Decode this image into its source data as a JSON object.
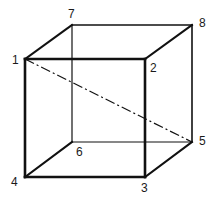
{
  "diagram": {
    "vertices": [
      {
        "id": "1",
        "label": "1",
        "x": 25,
        "y": 59,
        "label_x": 12,
        "label_y": 64
      },
      {
        "id": "2",
        "label": "2",
        "x": 145,
        "y": 59,
        "label_x": 150,
        "label_y": 72
      },
      {
        "id": "3",
        "label": "3",
        "x": 145,
        "y": 177,
        "label_x": 142,
        "label_y": 192
      },
      {
        "id": "4",
        "label": "4",
        "x": 25,
        "y": 177,
        "label_x": 11,
        "label_y": 186
      },
      {
        "id": "5",
        "label": "5",
        "x": 192,
        "y": 142,
        "label_x": 199,
        "label_y": 145
      },
      {
        "id": "6",
        "label": "6",
        "x": 72,
        "y": 142,
        "label_x": 76,
        "label_y": 156
      },
      {
        "id": "7",
        "label": "7",
        "x": 72,
        "y": 25,
        "label_x": 68,
        "label_y": 18
      },
      {
        "id": "8",
        "label": "8",
        "x": 192,
        "y": 25,
        "label_x": 199,
        "label_y": 27
      }
    ],
    "edges": [
      {
        "from": "1",
        "to": "2",
        "style": "solid-bold"
      },
      {
        "from": "2",
        "to": "3",
        "style": "solid-bold"
      },
      {
        "from": "3",
        "to": "4",
        "style": "solid-bold"
      },
      {
        "from": "4",
        "to": "1",
        "style": "solid-bold"
      },
      {
        "from": "1",
        "to": "7",
        "style": "solid-bold"
      },
      {
        "from": "7",
        "to": "8",
        "style": "solid-bold"
      },
      {
        "from": "8",
        "to": "2",
        "style": "solid-bold"
      },
      {
        "from": "8",
        "to": "5",
        "style": "solid-bold"
      },
      {
        "from": "5",
        "to": "3",
        "style": "solid-bold"
      },
      {
        "from": "7",
        "to": "6",
        "style": "hidden-thin"
      },
      {
        "from": "6",
        "to": "5",
        "style": "hidden-thin"
      },
      {
        "from": "6",
        "to": "4",
        "style": "solid-bold"
      },
      {
        "from": "1",
        "to": "5",
        "style": "dash-dot-diagonal"
      }
    ],
    "labels": {
      "v1": "1",
      "v2": "2",
      "v3": "3",
      "v4": "4",
      "v5": "5",
      "v6": "6",
      "v7": "7",
      "v8": "8"
    },
    "colors": {
      "stroke": "#111111",
      "background": "#ffffff"
    }
  }
}
